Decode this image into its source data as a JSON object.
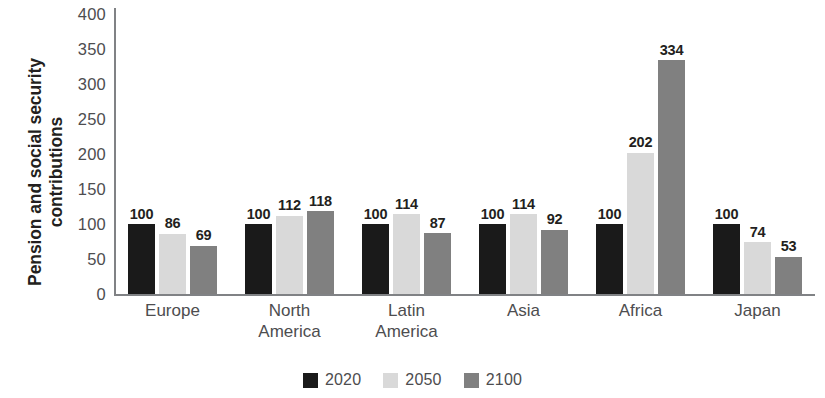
{
  "chart_data": {
    "type": "bar",
    "title": "",
    "subtitle": "",
    "xlabel": "",
    "ylabel": "Pension and social security contributions",
    "ylabel_lines": [
      "Pension and social security",
      "contributions"
    ],
    "categories": [
      "Europe",
      "North America",
      "Latin America",
      "Asia",
      "Africa",
      "Japan"
    ],
    "category_label_lines": [
      [
        "Europe"
      ],
      [
        "North",
        "America"
      ],
      [
        "Latin",
        "America"
      ],
      [
        "Asia"
      ],
      [
        "Africa"
      ],
      [
        "Japan"
      ]
    ],
    "series": [
      {
        "name": "2020",
        "color": "#1a1a1a",
        "values": [
          100,
          100,
          100,
          100,
          100,
          100
        ]
      },
      {
        "name": "2050",
        "color": "#d9d9d9",
        "values": [
          86,
          112,
          114,
          114,
          202,
          74
        ]
      },
      {
        "name": "2100",
        "color": "#808080",
        "values": [
          69,
          118,
          87,
          92,
          334,
          53
        ]
      }
    ],
    "ylim": [
      0,
      400
    ],
    "ytick_values": [
      0,
      50,
      100,
      150,
      200,
      250,
      300,
      350,
      400
    ],
    "ytick_labels": [
      "0",
      "50",
      "100",
      "150",
      "200",
      "250",
      "300",
      "350",
      "400"
    ],
    "grid": false,
    "legend_position": "bottom",
    "data_labels": true,
    "data_label_values": [
      [
        "100",
        "86",
        "69"
      ],
      [
        "100",
        "112",
        "118"
      ],
      [
        "100",
        "114",
        "87"
      ],
      [
        "100",
        "114",
        "92"
      ],
      [
        "100",
        "202",
        "334"
      ],
      [
        "100",
        "74",
        "53"
      ]
    ],
    "axis_color": "#808285",
    "tick_text_color": "#4d4d4f",
    "label_text_color": "#231f20",
    "background": "#ffffff"
  },
  "legend": {
    "items": [
      {
        "label": "2020",
        "color": "#1a1a1a"
      },
      {
        "label": "2050",
        "color": "#d9d9d9"
      },
      {
        "label": "2100",
        "color": "#808080"
      }
    ]
  }
}
